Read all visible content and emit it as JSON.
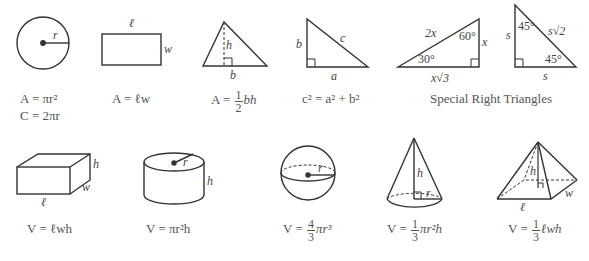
{
  "figures": {
    "circle": {
      "labels": {
        "radius": "r"
      },
      "formulas": [
        "A = πr²",
        "C = 2πr"
      ]
    },
    "rectangle": {
      "labels": {
        "length": "ℓ",
        "width": "w"
      },
      "formula": "A = ℓw"
    },
    "triangle": {
      "labels": {
        "height": "h",
        "base": "b"
      },
      "formula": {
        "lhs": "A = ",
        "num": "1",
        "den": "2",
        "rhs": "bh"
      }
    },
    "right_triangle": {
      "labels": {
        "leg_b": "b",
        "hyp": "c",
        "leg_a": "a"
      },
      "formula": "c² = a² + b²"
    },
    "special_30_60_90": {
      "labels": {
        "hyp": "2x",
        "angle_top": "60°",
        "short_leg": "x",
        "angle_bottom": "30°",
        "long_leg": "x√3"
      }
    },
    "special_45_45_90": {
      "labels": {
        "leg_left": "s",
        "angle_top": "45°",
        "hyp": "s√2",
        "angle_bottom": "45°",
        "leg_bottom": "s"
      }
    },
    "special_caption": "Special Right Triangles",
    "box": {
      "labels": {
        "height": "h",
        "width": "w",
        "length": "ℓ"
      },
      "formula": "V = ℓwh"
    },
    "cylinder": {
      "labels": {
        "radius": "r",
        "height": "h"
      },
      "formula": "V = πr²h"
    },
    "sphere": {
      "labels": {
        "radius": "r"
      },
      "formula": {
        "lhs": "V = ",
        "num": "4",
        "den": "3",
        "rhs": "πr³"
      }
    },
    "cone": {
      "labels": {
        "height": "h",
        "radius": "r"
      },
      "formula": {
        "lhs": "V = ",
        "num": "1",
        "den": "3",
        "rhs": "πr²h"
      }
    },
    "pyramid": {
      "labels": {
        "height": "h",
        "width": "w",
        "length": "ℓ"
      },
      "formula": {
        "lhs": "V = ",
        "num": "1",
        "den": "3",
        "rhs": "ℓwh"
      }
    }
  }
}
